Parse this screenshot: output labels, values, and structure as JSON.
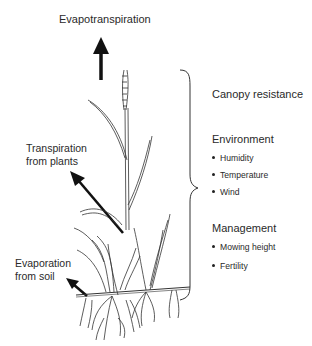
{
  "labels": {
    "evapotranspiration": "Evapotranspiration",
    "transpiration_line1": "Transpiration",
    "transpiration_line2": "from plants",
    "evaporation_line1": "Evaporation",
    "evaporation_line2": "from soil"
  },
  "factors": {
    "canopy": "Canopy resistance",
    "environment": {
      "title": "Environment",
      "items": [
        "Humidity",
        "Temperature",
        "Wind"
      ]
    },
    "management": {
      "title": "Management",
      "items": [
        "Mowing height",
        "Fertility"
      ]
    }
  },
  "colors": {
    "ink": "#222222",
    "background": "#ffffff"
  }
}
